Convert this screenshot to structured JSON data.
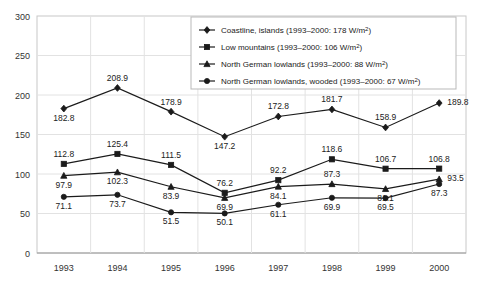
{
  "chart_data": {
    "type": "line",
    "title": "",
    "xlabel": "",
    "ylabel": "",
    "categories": [
      "1993",
      "1994",
      "1995",
      "1996",
      "1997",
      "1998",
      "1999",
      "2000"
    ],
    "x": [
      1993,
      1994,
      1995,
      1996,
      1997,
      1998,
      1999,
      2000
    ],
    "ylim": [
      0,
      300
    ],
    "yticks": [
      0,
      50,
      100,
      150,
      200,
      250,
      300
    ],
    "ytick_labels": [
      "0",
      "50",
      "100",
      "150",
      "200",
      "250",
      "300"
    ],
    "grid": true,
    "legend_position": "top-right",
    "series": [
      {
        "name": "Coastline, islands",
        "legend_label": "Coastline, islands (1993–2000: 178 W/m²)",
        "legend_prefix": "Coastline, islands (1993–2000: 178 W/m",
        "marker": "diamond",
        "mean": 178,
        "unit": "W/m2",
        "values": [
          182.8,
          208.9,
          178.9,
          147.2,
          172.8,
          181.7,
          158.9,
          189.8
        ],
        "labels": [
          "182.8",
          "208.9",
          "178.9",
          "147.2",
          "172.8",
          "181.7",
          "158.9",
          "189.8"
        ]
      },
      {
        "name": "Low mountains",
        "legend_label": "Low mountains (1993–2000: 106 W/m²)",
        "legend_prefix": "Low mountains (1993–2000: 106 W/m",
        "marker": "square",
        "mean": 106,
        "unit": "W/m2",
        "values": [
          112.8,
          125.4,
          111.5,
          76.2,
          92.2,
          118.6,
          106.7,
          106.8
        ],
        "labels": [
          "112.8",
          "125.4",
          "111.5",
          "76.2",
          "92.2",
          "118.6",
          "106.7",
          "106.8"
        ]
      },
      {
        "name": "North German lowlands",
        "legend_label": "North German lowlands (1993–2000: 88 W/m²)",
        "legend_prefix": "North German lowlands (1993–2000: 88 W/m",
        "marker": "triangle",
        "mean": 88,
        "unit": "W/m2",
        "values": [
          97.9,
          102.3,
          83.9,
          69.9,
          84.1,
          87.3,
          81.1,
          93.5
        ],
        "labels": [
          "97.9",
          "102.3",
          "83.9",
          "69.9",
          "84.1",
          "87.3",
          "81.1",
          "93.5"
        ]
      },
      {
        "name": "North German lowlands, wooded",
        "legend_label": "North German lowlands, wooded (1993–2000: 67 W/m²)",
        "legend_prefix": "North German lowlands, wooded (1993–2000: 67 W/m",
        "marker": "circle",
        "mean": 67,
        "unit": "W/m2",
        "values": [
          71.1,
          73.7,
          51.5,
          50.1,
          61.1,
          69.9,
          69.5,
          87.3
        ],
        "labels": [
          "71.1",
          "73.7",
          "51.5",
          "50.1",
          "61.1",
          "69.9",
          "69.5",
          "87.3"
        ]
      }
    ],
    "colors": {
      "line": "#1b1b1b",
      "grid": "#e2e2e2",
      "frame": "#c8c8c8",
      "text": "#222222"
    }
  }
}
